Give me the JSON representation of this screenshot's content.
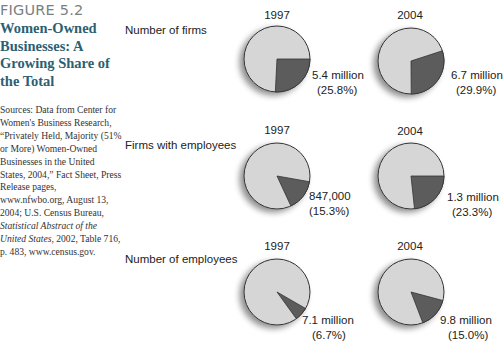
{
  "figure": {
    "number": "FIGURE 5.2",
    "title": "Women-Owned Businesses: A Growing Share of the Total",
    "source_parts": [
      "Sources: Data from Center for Women's Business Research, “Privately Held, Majority (51% or More) Women-Owned Businesses in the United States, 2004,” Fact Sheet, Press Release pages, www.nfwbo.org, August 13, 2004; U.S. Census Bureau, ",
      "Statistical Abstract of the United States",
      ", 2002, Table 716, p. 483, www.census.gov."
    ]
  },
  "colors": {
    "pie_base": "#d6d6d6",
    "pie_slice": "#5c5c5c",
    "pie_outline": "#333333",
    "title": "#2d5f73",
    "figure_number": "#7a7f82"
  },
  "chart_data": {
    "type": "pie",
    "title": "Women-Owned Businesses: A Growing Share of the Total",
    "columns": [
      "1997",
      "2004"
    ],
    "rows": [
      {
        "label": "Number of firms",
        "pies": [
          {
            "year": "1997",
            "value_label": "5.4 million",
            "pct_label": "(25.8%)",
            "value": 5.4,
            "unit": "million",
            "share": 25.8
          },
          {
            "year": "2004",
            "value_label": "6.7 million",
            "pct_label": "(29.9%)",
            "value": 6.7,
            "unit": "million",
            "share": 29.9
          }
        ]
      },
      {
        "label": "Firms with employees",
        "pies": [
          {
            "year": "1997",
            "value_label": "847,000",
            "pct_label": "(15.3%)",
            "value": 847000,
            "unit": "",
            "share": 15.3
          },
          {
            "year": "2004",
            "value_label": "1.3 million",
            "pct_label": "(23.3%)",
            "value": 1.3,
            "unit": "million",
            "share": 23.3
          }
        ]
      },
      {
        "label": "Number of employees",
        "pies": [
          {
            "year": "1997",
            "value_label": "7.1 million",
            "pct_label": "(6.7%)",
            "value": 7.1,
            "unit": "million",
            "share": 6.7
          },
          {
            "year": "2004",
            "value_label": "9.8 million",
            "pct_label": "(15.0%)",
            "value": 9.8,
            "unit": "million",
            "share": 15.0
          }
        ]
      }
    ],
    "legend": "dark slice = women-owned share of total"
  }
}
